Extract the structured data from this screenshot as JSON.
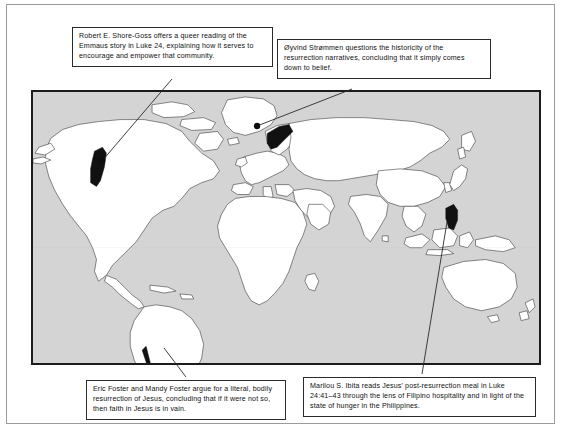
{
  "page": {
    "type": "annotated-world-map-figure",
    "background_color": "#ffffff",
    "frame_color": "#9a9a9a"
  },
  "map": {
    "name": "world-map",
    "ocean_color": "#d4d4d4",
    "land_color": "#ffffff",
    "outline_color": "#2b2b2b",
    "highlight_color": "#111111",
    "border_color": "#1c1c1c",
    "projection": "equirectangular",
    "highlighted_regions": [
      {
        "name": "western-united-states",
        "label": "United States"
      },
      {
        "name": "norway",
        "label": "Norway"
      },
      {
        "name": "chile",
        "label": "Chile"
      },
      {
        "name": "philippines",
        "label": "Philippines"
      }
    ],
    "markers": [
      {
        "name": "marker-united-states",
        "x": 102,
        "y": 161
      },
      {
        "name": "marker-norway",
        "x": 257,
        "y": 126
      }
    ]
  },
  "callouts": {
    "top_left": {
      "name": "callout-shore-goss",
      "text": "Robert E. Shore-Goss offers a queer reading of the Emmaus story in Luke 24, explaining how it serves to encourage and empower that community."
    },
    "top_right": {
      "name": "callout-strommen",
      "text": "Øyvind Strømmen questions the historicity of the resurrection narratives, concluding that it simply comes down to belief."
    },
    "bottom_left": {
      "name": "callout-foster",
      "text": "Eric Foster and Mandy Foster argue for a literal, bodily resurrection of Jesus, concluding that if it were not so, then faith in Jesus is in vain."
    },
    "bottom_right": {
      "name": "callout-ibita",
      "text": "Marilou S. Ibita reads Jesus' post-resurrection meal in Luke 24:41–43 through the lens of Filipino hospitality and in light of the state of hunger in the Philippines."
    }
  },
  "connectors": [
    {
      "name": "connector-shore-goss",
      "from": "callout-top-left",
      "to": "marker-united-states"
    },
    {
      "name": "connector-strommen",
      "from": "callout-top-right",
      "to": "marker-norway"
    },
    {
      "name": "connector-foster",
      "from": "callout-bottom-left",
      "to": "region-chile"
    },
    {
      "name": "connector-ibita",
      "from": "callout-bottom-right",
      "to": "region-philippines"
    }
  ]
}
